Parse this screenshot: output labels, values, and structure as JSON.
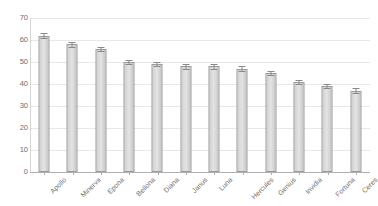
{
  "chart_data": {
    "type": "bar",
    "title": "",
    "subtitle": "",
    "xlabel": "",
    "ylabel": "",
    "categories": [
      "Apollo",
      "Minerva",
      "Epona",
      "Bellona",
      "Diana",
      "Janus",
      "Luna",
      "Hercules",
      "Genius",
      "Invidia",
      "Fortuna",
      "Ceres"
    ],
    "values": [
      62,
      58,
      56,
      50,
      49,
      48,
      48,
      47,
      45,
      41,
      39,
      37
    ],
    "errors": [
      1.2,
      1.0,
      1.0,
      1.0,
      1.0,
      1.0,
      1.0,
      1.0,
      1.0,
      1.0,
      1.0,
      1.0
    ],
    "ylim": [
      0,
      70
    ],
    "ytick_labels": [
      "70",
      "60",
      "50",
      "40",
      "30",
      "20",
      "10",
      "0"
    ],
    "ytick_values": [
      70,
      60,
      50,
      40,
      30,
      20,
      10,
      0
    ],
    "grid": true,
    "grid_axis": "y",
    "legend": false,
    "legend_position": "none",
    "bar_fill_color": "#d9d9d9",
    "bar_border_color": "#9a9a9a",
    "error_bar_color": "#8a8a8a",
    "gridline_color": "#e8e8e8",
    "axis_color": "#b0b0b0",
    "tick_label_color": "#6e6e6e",
    "background_color": "#ffffff",
    "xlabel_rotation": -45
  }
}
